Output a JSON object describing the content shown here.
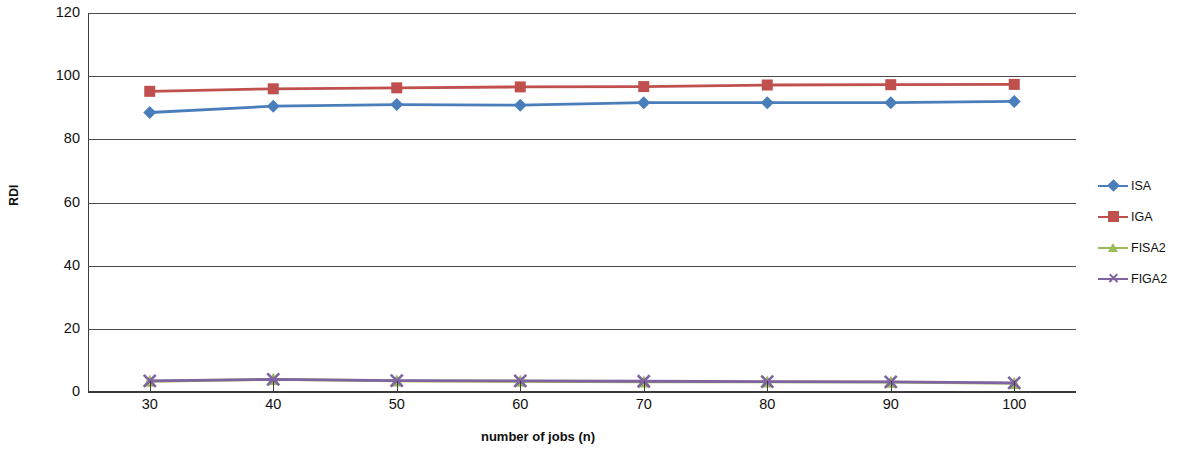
{
  "chart_data": {
    "type": "line",
    "title": "",
    "xlabel": "number of  jobs (n)",
    "ylabel": "RDI",
    "x": [
      30,
      40,
      50,
      60,
      70,
      80,
      90,
      100
    ],
    "xtick_labels": [
      "30",
      "40",
      "50",
      "60",
      "70",
      "80",
      "90",
      "100"
    ],
    "ytick_labels": [
      "0",
      "20",
      "40",
      "60",
      "80",
      "100",
      "120"
    ],
    "yticks": [
      0,
      20,
      40,
      60,
      80,
      100,
      120
    ],
    "ylim": [
      0,
      120
    ],
    "xlim": [
      25,
      105
    ],
    "grid": "horizontal",
    "legend_position": "right",
    "series": [
      {
        "name": "ISA",
        "color": "#4A7EBB",
        "marker": "diamond",
        "values": [
          88.5,
          90.5,
          91.0,
          90.8,
          91.6,
          91.6,
          91.6,
          92.0
        ]
      },
      {
        "name": "IGA",
        "color": "#C0504D",
        "marker": "square",
        "values": [
          95.2,
          96.0,
          96.3,
          96.6,
          96.7,
          97.2,
          97.3,
          97.4
        ]
      },
      {
        "name": "FISA2",
        "color": "#9BBB59",
        "marker": "triangle",
        "values": [
          3.4,
          4.0,
          3.5,
          3.4,
          3.2,
          3.2,
          3.1,
          2.7
        ]
      },
      {
        "name": "FIGA2",
        "color": "#8064A2",
        "marker": "x",
        "values": [
          3.5,
          4.0,
          3.6,
          3.5,
          3.4,
          3.3,
          3.2,
          2.9
        ]
      }
    ]
  },
  "legend": {
    "items": [
      {
        "label": "ISA",
        "color": "#4A7EBB",
        "marker": "diamond"
      },
      {
        "label": "IGA",
        "color": "#C0504D",
        "marker": "square"
      },
      {
        "label": "FISA2",
        "color": "#9BBB59",
        "marker": "triangle"
      },
      {
        "label": "FIGA2",
        "color": "#8064A2",
        "marker": "x"
      }
    ]
  },
  "axes": {
    "y_title": "RDI",
    "x_title": "number of  jobs (n)"
  }
}
